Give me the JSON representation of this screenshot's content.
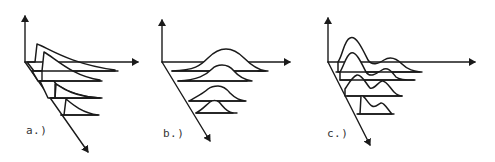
{
  "figure": {
    "panels": [
      {
        "id": "a",
        "label": "a.)",
        "curve_shape": "sharp rise with exponential decay"
      },
      {
        "id": "b",
        "label": "b.)",
        "curve_shape": "single symmetric gaussian bump"
      },
      {
        "id": "c",
        "label": "c.)",
        "curve_shape": "bimodal: large peak followed by smaller peak"
      }
    ],
    "colors": {
      "ink": "#1a1a1a",
      "background": "#ffffff",
      "label": "#333333"
    }
  }
}
